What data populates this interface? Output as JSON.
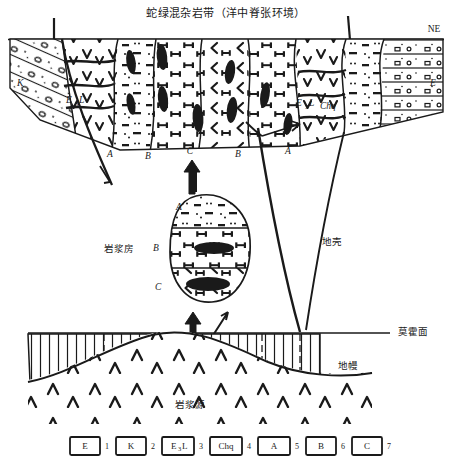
{
  "figure": {
    "title": "蛇绿混杂岩带（洋中脊张环境）",
    "type": "geological-cross-section"
  },
  "direction_labels": {
    "right_end": "NE"
  },
  "surface_units": {
    "left_label": "K",
    "right_label": "E",
    "left_formation": "E",
    "left_formation_sub": "3",
    "left_formation_tail": "L",
    "right_formation": "Chq",
    "zone_labels": [
      "A",
      "B",
      "C",
      "B",
      "A"
    ]
  },
  "magma_chamber": {
    "name": "岩浆房",
    "zones": [
      "A",
      "B",
      "C"
    ]
  },
  "layers": {
    "crust": "地壳",
    "moho": "莫霍面",
    "mantle": "地幔",
    "magma_source": "岩浆源"
  },
  "legend": {
    "items": [
      {
        "box": "E",
        "sub": "",
        "tail": "",
        "num": "1"
      },
      {
        "box": "K",
        "sub": "",
        "tail": "",
        "num": "2"
      },
      {
        "box": "E",
        "sub": "3",
        "tail": "L",
        "num": "3"
      },
      {
        "box": "Chq",
        "sub": "",
        "tail": "",
        "num": "4"
      },
      {
        "box": "A",
        "sub": "",
        "tail": "",
        "num": "5"
      },
      {
        "box": "B",
        "sub": "",
        "tail": "",
        "num": "6"
      },
      {
        "box": "C",
        "sub": "",
        "tail": "",
        "num": "7"
      }
    ]
  },
  "colors": {
    "ink": "#1a1a1a",
    "paper": "#ffffff"
  }
}
